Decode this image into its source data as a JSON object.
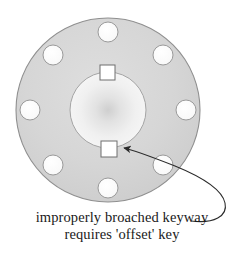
{
  "figure": {
    "caption": {
      "line1": "improperly broached keyway",
      "line2": "requires 'offset' key"
    }
  },
  "colors": {
    "background": "#ffffff",
    "flange_face": "#d2d2d2",
    "flange_face_light": "#dcdcdc",
    "flange_outline": "#8c8c8c",
    "hub_light": "#f2f2f2",
    "hub_shadow": "#c9c9c9",
    "bolt_hole_fill": "#ffffff",
    "bolt_hole_outline": "#9a9a9a",
    "keyway_fill": "#ffffff",
    "keyway_outline": "#6e6e6e",
    "annotation_line": "#2b2b2b",
    "caption_text": "#1a1a1a"
  },
  "geometry": {
    "flange": {
      "cx": 108,
      "cy": 110,
      "rx": 92,
      "ry": 92
    },
    "hub_bore": {
      "cx": 108,
      "cy": 110,
      "r": 38
    },
    "bolt_hole_radius": 10,
    "bolt_hole_circle_radius": 78,
    "bolt_hole_count": 8
  },
  "parts": {
    "flange_disk_label": "flange-disk",
    "hub_bore_label": "center-bore",
    "keyway_top_label": "keyway-top",
    "keyway_bottom_label": "keyway-bottom-offset",
    "annotation_label": "keyway-callout-arrow"
  },
  "bolt_holes": [
    {
      "id": "bolt-hole-n",
      "cx": 108,
      "cy": 32,
      "r": 10
    },
    {
      "id": "bolt-hole-ne",
      "cx": 163,
      "cy": 55,
      "r": 10
    },
    {
      "id": "bolt-hole-e",
      "cx": 186,
      "cy": 110,
      "r": 10
    },
    {
      "id": "bolt-hole-se",
      "cx": 163,
      "cy": 165,
      "r": 10
    },
    {
      "id": "bolt-hole-s",
      "cx": 108,
      "cy": 188,
      "r": 10
    },
    {
      "id": "bolt-hole-sw",
      "cx": 53,
      "cy": 165,
      "r": 10
    },
    {
      "id": "bolt-hole-w",
      "cx": 30,
      "cy": 110,
      "r": 10
    },
    {
      "id": "bolt-hole-nw",
      "cx": 53,
      "cy": 55,
      "r": 10
    }
  ],
  "keyways": [
    {
      "id": "keyway-top",
      "x": 100,
      "y": 65,
      "w": 15,
      "h": 15
    },
    {
      "id": "keyway-bottom",
      "x": 101,
      "y": 141,
      "w": 16,
      "h": 16
    }
  ],
  "annotation": {
    "arrow_path": "M 191,221 C 214,224 228,216 225,203 C 222,189 202,177 175,166 C 152,157 134,150 124,148",
    "arrow_tip": {
      "x": 122,
      "y": 148
    }
  }
}
